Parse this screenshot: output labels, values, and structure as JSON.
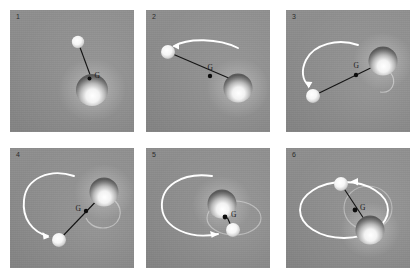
{
  "figure": {
    "title": "",
    "background_color": "#ffffff",
    "panel_background_color": "#8b8b8b",
    "trail_color": "#ffffff",
    "rod_color": "#141414",
    "barycenter_color": "#0d0d0d",
    "label_color": "#2c2c2c",
    "columns": 3,
    "rows": 2
  },
  "panels": [
    {
      "number": "1",
      "barycenter_label": "G",
      "caption": "",
      "primary_body": "large-sphere",
      "secondary_body": "small-sphere",
      "trail_present": "false",
      "trail_arrow": "false"
    },
    {
      "number": "2",
      "barycenter_label": "G",
      "caption": "",
      "primary_body": "large-sphere",
      "secondary_body": "small-sphere",
      "trail_present": "true",
      "trail_arrow": "true"
    },
    {
      "number": "3",
      "barycenter_label": "G",
      "caption": "",
      "primary_body": "large-sphere",
      "secondary_body": "small-sphere",
      "trail_present": "true",
      "trail_arrow": "true"
    },
    {
      "number": "4",
      "barycenter_label": "G",
      "caption": "",
      "primary_body": "large-sphere",
      "secondary_body": "small-sphere",
      "trail_present": "true",
      "trail_arrow": "true"
    },
    {
      "number": "5",
      "barycenter_label": "G",
      "caption": "",
      "primary_body": "large-sphere",
      "secondary_body": "small-sphere",
      "trail_present": "true",
      "trail_arrow": "true"
    },
    {
      "number": "6",
      "barycenter_label": "G",
      "caption": "",
      "primary_body": "large-sphere",
      "secondary_body": "small-sphere",
      "trail_present": "true",
      "trail_arrow": "true"
    }
  ]
}
